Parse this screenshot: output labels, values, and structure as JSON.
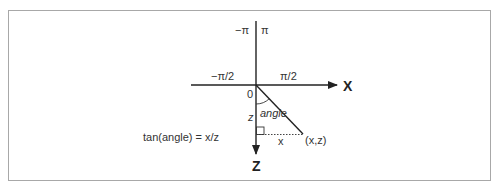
{
  "diagram": {
    "axes": {
      "x_label": "X",
      "z_label": "Z"
    },
    "angle_labels": {
      "top_left": "−π",
      "top_right": "π",
      "left": "−π/2",
      "right": "π/2",
      "origin": "0"
    },
    "triangle": {
      "angle_label": "angle",
      "z_label": "z",
      "x_label": "x",
      "point_label": "(x,z)"
    },
    "formula": "tan(angle) = x/z",
    "colors": {
      "line": "#222222",
      "text": "#333333",
      "border": "#a8a8a8"
    }
  }
}
